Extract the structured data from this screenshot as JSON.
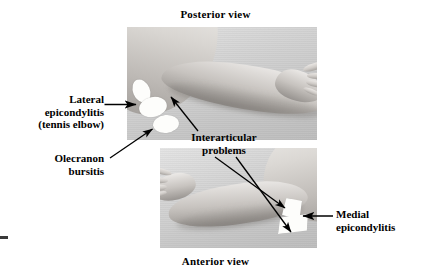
{
  "figure": {
    "kind": "anatomical-photo-figure",
    "background_color": "#ffffff",
    "text_color": "#000000"
  },
  "captions": {
    "top": "Posterior view",
    "bottom": "Anterior view"
  },
  "panels": {
    "posterior": {
      "caption": "Posterior view",
      "description": "grayscale photograph of a left arm seen from behind, elbow at lower left and hand at right"
    },
    "anterior": {
      "caption": "Anterior view",
      "description": "grayscale photograph of an arm seen from the front, hand at left and flexed elbow at right"
    }
  },
  "annotations": [
    {
      "id": "lateral-epicondylitis",
      "lines": [
        "Lateral",
        "epicondylitis",
        "(tennis elbow)"
      ],
      "arrow": "horizontal-right",
      "points_to": "lateral epicondyle marker in posterior view"
    },
    {
      "id": "olecranon-bursitis",
      "lines": [
        "Olecranon",
        "bursitis"
      ],
      "arrow": "diagonal-up-right",
      "points_to": "olecranon marker in posterior view"
    },
    {
      "id": "interarticular-problems",
      "lines": [
        "Interarticular",
        "problems"
      ],
      "arrow": "three-arrows-up-left-and-down-right",
      "points_to": "elbow joint in both posterior and anterior views"
    },
    {
      "id": "medial-epicondylitis",
      "lines": [
        "Medial",
        "epicondylitis"
      ],
      "arrow": "horizontal-left",
      "points_to": "medial epicondyle marker in anterior view"
    }
  ],
  "markers": {
    "posterior": [
      {
        "name": "lateral-epicondyle-upper",
        "shape": "ellipse",
        "color": "#fdfdfb"
      },
      {
        "name": "lateral-epicondyle-mid",
        "shape": "ellipse",
        "color": "#fdfdfb"
      },
      {
        "name": "olecranon",
        "shape": "ellipse",
        "color": "#fdfdfb"
      }
    ],
    "anterior": [
      {
        "name": "medial-epicondyle-upper",
        "shape": "quadrilateral",
        "color": "#fdfdfb"
      },
      {
        "name": "medial-epicondyle-lower",
        "shape": "quadrilateral",
        "color": "#fdfdfb"
      }
    ]
  }
}
